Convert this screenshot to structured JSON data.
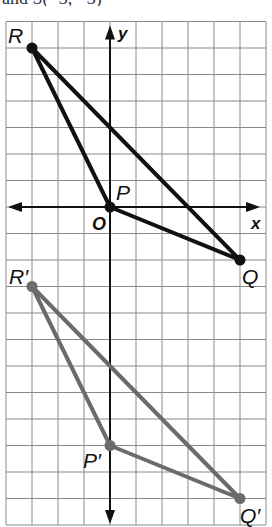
{
  "header_text_partial": "and S(−3, −3)",
  "figure": {
    "grid": {
      "x_min": -4,
      "x_max": 6,
      "y_min": -12,
      "y_max": 7,
      "origin_px": [
        110,
        207
      ],
      "unit_px_x": 26,
      "unit_px_y": 26.5,
      "line_color": "#8a8a8a"
    },
    "axes": {
      "x_label": "x",
      "y_label": "y",
      "origin_label": "O",
      "color": "#111111"
    },
    "triangles": [
      {
        "name": "PQR",
        "color": "#111111",
        "vertices": [
          {
            "label": "R",
            "x": -3,
            "y": 6
          },
          {
            "label": "P",
            "x": 0,
            "y": 0
          },
          {
            "label": "Q",
            "x": 5,
            "y": -2
          }
        ]
      },
      {
        "name": "P'Q'R'",
        "color": "#6b6b6b",
        "vertices": [
          {
            "label": "R'",
            "x": -3,
            "y": -3
          },
          {
            "label": "P'",
            "x": 0,
            "y": -9
          },
          {
            "label": "Q'",
            "x": 5,
            "y": -11
          }
        ]
      }
    ],
    "labels": {
      "R": "R",
      "P": "P",
      "Q": "Q",
      "R_prime": "R′",
      "P_prime": "P′",
      "Q_prime": "Q′"
    }
  }
}
